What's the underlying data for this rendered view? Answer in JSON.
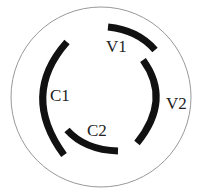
{
  "diagram": {
    "outer_circle": {
      "cx": 101,
      "cy": 97,
      "r": 90,
      "stroke": "#999999"
    },
    "arcs": [
      {
        "id": "V1",
        "label": "V1",
        "path": "M108,27 Q138,30 155,50",
        "label_x": 106,
        "label_y": 52
      },
      {
        "id": "V2",
        "label": "V2",
        "path": "M143,60 Q172,100 137,143",
        "label_x": 166,
        "label_y": 109
      },
      {
        "id": "C1",
        "label": "C1",
        "path": "M67,42 Q20,95 64,155",
        "label_x": 50,
        "label_y": 101
      },
      {
        "id": "C2",
        "label": "C2",
        "path": "M67,130 Q85,150 118,151",
        "label_x": 87,
        "label_y": 136
      }
    ],
    "arc_color": "#111111",
    "arc_width": 7
  }
}
